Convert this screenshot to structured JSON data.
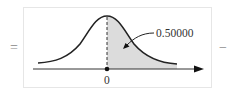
{
  "diagram": {
    "type": "normal-distribution-shaded-area",
    "left_operator": "=",
    "right_operator": "−",
    "area_label": "0.50000",
    "axis_tick_label": "0",
    "shaded_region": "right of mean (z >= 0)",
    "colors": {
      "curve": "#222222",
      "shade": "#dcdcdc",
      "axis": "#222222",
      "frame": "#e6e6e6",
      "operator": "#888888"
    }
  }
}
